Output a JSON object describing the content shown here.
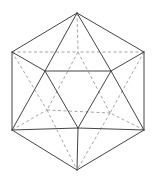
{
  "figure": {
    "title": "",
    "shape": "icosahedron",
    "colors": {
      "visible_edge": "#444444",
      "hidden_edge": "#9a9a9a",
      "background": "#ffffff"
    },
    "vertices": {
      "T": [
        77,
        13
      ],
      "UL": [
        12,
        52
      ],
      "UR": [
        144,
        52
      ],
      "ML": [
        45,
        71
      ],
      "MR": [
        111,
        71
      ],
      "LL": [
        12,
        130
      ],
      "LR": [
        144,
        130
      ],
      "C": [
        78,
        128
      ],
      "B": [
        77,
        170
      ],
      "H0": [
        78,
        52
      ],
      "HL": [
        47,
        110
      ],
      "HR": [
        110,
        113
      ]
    },
    "visible_edges": [
      [
        "T",
        "UL"
      ],
      [
        "T",
        "UR"
      ],
      [
        "T",
        "ML"
      ],
      [
        "T",
        "MR"
      ],
      [
        "UL",
        "ML"
      ],
      [
        "UR",
        "MR"
      ],
      [
        "ML",
        "MR"
      ],
      [
        "UL",
        "LL"
      ],
      [
        "UR",
        "LR"
      ],
      [
        "ML",
        "LL"
      ],
      [
        "ML",
        "C"
      ],
      [
        "MR",
        "C"
      ],
      [
        "MR",
        "LR"
      ],
      [
        "LL",
        "C"
      ],
      [
        "C",
        "LR"
      ],
      [
        "LL",
        "B"
      ],
      [
        "LR",
        "B"
      ],
      [
        "C",
        "B"
      ]
    ],
    "hidden_edges": [
      [
        "T",
        "H0"
      ],
      [
        "UL",
        "H0"
      ],
      [
        "UR",
        "H0"
      ],
      [
        "H0",
        "HL"
      ],
      [
        "H0",
        "HR"
      ],
      [
        "HL",
        "HR"
      ],
      [
        "UL",
        "HL"
      ],
      [
        "LL",
        "HL"
      ],
      [
        "HL",
        "B"
      ],
      [
        "UR",
        "HR"
      ],
      [
        "LR",
        "HR"
      ],
      [
        "HR",
        "B"
      ]
    ]
  }
}
